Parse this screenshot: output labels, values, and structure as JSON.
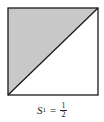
{
  "figure": {
    "shape": "square",
    "fill_region": "upper-left triangle",
    "fill_color": "#c8c8c8",
    "stroke_color": "#1a1a1a",
    "diagonal": "bottom-left to top-right"
  },
  "label": {
    "variable": "S",
    "subscript": "1",
    "equals": "=",
    "numerator": "1",
    "denominator": "2"
  }
}
